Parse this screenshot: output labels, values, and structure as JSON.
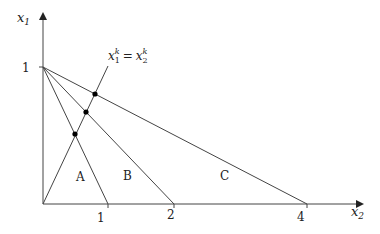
{
  "diagram": {
    "axes": {
      "y_label": "x",
      "y_label_sub": "1",
      "x_label": "x",
      "x_label_sub": "2",
      "y_tick_label": "1",
      "x_tick_labels": [
        "1",
        "2",
        "4"
      ]
    },
    "annotation": {
      "base": "x",
      "sub1": "1",
      "sup1": "k",
      "eq": "=",
      "sub2": "2",
      "sup2": "k"
    },
    "regions": [
      "A",
      "B",
      "C"
    ],
    "lines": [
      {
        "from": [
          0,
          1
        ],
        "to": [
          1,
          0
        ]
      },
      {
        "from": [
          0,
          1
        ],
        "to": [
          2,
          0
        ]
      },
      {
        "from": [
          0,
          1
        ],
        "to": [
          4,
          0
        ]
      },
      {
        "from": [
          0,
          0
        ],
        "to": "diagonal x1=x2"
      }
    ],
    "intersection_points": [
      {
        "x2": 0.5,
        "x1": 0.5
      },
      {
        "x2": 0.667,
        "x1": 0.667
      },
      {
        "x2": 0.8,
        "x1": 0.8
      }
    ],
    "line_color": "#333333"
  }
}
